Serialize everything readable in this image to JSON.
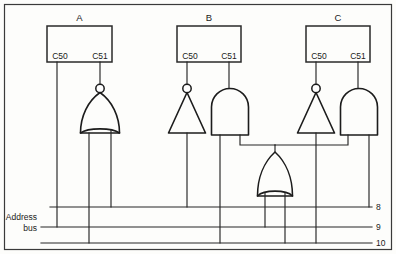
{
  "diagram": {
    "background_color": "#fdfdfb",
    "line_color": "#1c1c1c"
  },
  "chips": [
    {
      "id": "chip-a",
      "label": "A",
      "pins": [
        {
          "name": "C50",
          "x": 57
        },
        {
          "name": "C51",
          "x": 100
        }
      ],
      "box": {
        "x": 47,
        "y": 26,
        "w": 65,
        "h": 36
      }
    },
    {
      "id": "chip-b",
      "label": "B",
      "pins": [
        {
          "name": "C50",
          "x": 187
        },
        {
          "name": "C51",
          "x": 230
        }
      ],
      "box": {
        "x": 177,
        "y": 26,
        "w": 64,
        "h": 36
      }
    },
    {
      "id": "chip-c",
      "label": "C",
      "pins": [
        {
          "name": "C50",
          "x": 316
        },
        {
          "name": "C51",
          "x": 358
        }
      ],
      "box": {
        "x": 306,
        "y": 26,
        "w": 64,
        "h": 36
      }
    }
  ],
  "gates": [
    {
      "id": "gate-nor-a",
      "type": "NOR",
      "inverted": true,
      "orientation": "up"
    },
    {
      "id": "gate-inverter-b",
      "type": "NOT",
      "inverted": true,
      "orientation": "up"
    },
    {
      "id": "gate-and-b",
      "type": "AND",
      "inverted": false,
      "orientation": "up"
    },
    {
      "id": "gate-inverter-c",
      "type": "NOT",
      "inverted": true,
      "orientation": "up"
    },
    {
      "id": "gate-and-c",
      "type": "AND",
      "inverted": false,
      "orientation": "up"
    },
    {
      "id": "gate-or-mid",
      "type": "OR",
      "inverted": false,
      "orientation": "up"
    }
  ],
  "bus": {
    "label_line1": "Address",
    "label_line2": "bus",
    "lines": [
      {
        "name": "8",
        "y": 207
      },
      {
        "name": "9",
        "y": 227
      },
      {
        "name": "10",
        "y": 243
      }
    ]
  }
}
